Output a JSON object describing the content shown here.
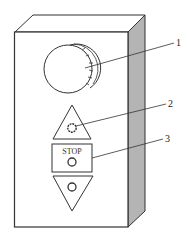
{
  "diagram": {
    "type": "control pendant / push-button station",
    "colors": {
      "line": "#333333",
      "side_face": "#b4b4b4",
      "background": "#ffffff"
    },
    "components": [
      {
        "id": "knob",
        "label": "1",
        "description": "rotary knob with knurled rim"
      },
      {
        "id": "up_button",
        "label": "2",
        "description": "up-arrow push button"
      },
      {
        "id": "stop_button",
        "label": "3",
        "description": "STOP push button",
        "text": "STOP"
      },
      {
        "id": "down_button",
        "label": "",
        "description": "down-arrow push button"
      }
    ],
    "labels": {
      "knob": "1",
      "up": "2",
      "stop": "3"
    },
    "stop_text": "STOP"
  }
}
